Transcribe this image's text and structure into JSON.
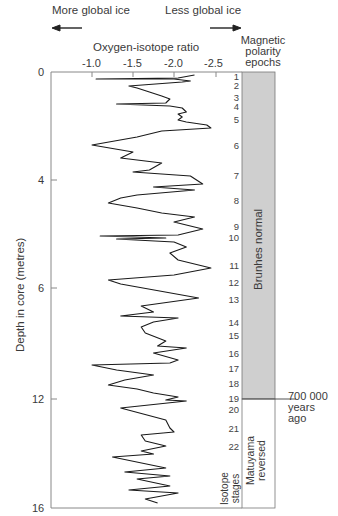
{
  "chart_data": {
    "type": "line",
    "title": "Oxygen-isotope ratio",
    "xlabel": "Oxygen-isotope ratio",
    "ylabel": "Depth in core (metres)",
    "x_ticks": [
      "-1.0",
      "-1.5",
      "-2.0",
      "-2.5"
    ],
    "x_reversed": true,
    "y_ticks": [
      "0",
      "4",
      "6",
      "12",
      "16"
    ],
    "grid": false,
    "annotations": {
      "left_arrow": "More global ice",
      "right_arrow": "Less global ice",
      "boundary": "700 000 years ago"
    },
    "series": [
      {
        "name": "Oxygen-isotope ratio vs depth",
        "points_ratio_ypx": [
          [
            -2.25,
            75
          ],
          [
            -2.05,
            78
          ],
          [
            -1.05,
            79
          ],
          [
            -2.0,
            79
          ],
          [
            -2.2,
            81
          ],
          [
            -2.1,
            82
          ],
          [
            -1.45,
            86
          ],
          [
            -1.55,
            88
          ],
          [
            -1.7,
            92
          ],
          [
            -1.85,
            96
          ],
          [
            -1.95,
            99
          ],
          [
            -1.9,
            103
          ],
          [
            -1.3,
            104
          ],
          [
            -1.95,
            106
          ],
          [
            -2.1,
            108
          ],
          [
            -2.15,
            112
          ],
          [
            -2.05,
            114
          ],
          [
            -2.1,
            117
          ],
          [
            -2.05,
            120
          ],
          [
            -2.15,
            122
          ],
          [
            -2.4,
            125
          ],
          [
            -2.45,
            128
          ],
          [
            -1.85,
            131
          ],
          [
            -1.55,
            137
          ],
          [
            -1.0,
            145
          ],
          [
            -1.5,
            152
          ],
          [
            -1.35,
            158
          ],
          [
            -1.85,
            163
          ],
          [
            -1.7,
            170
          ],
          [
            -1.5,
            172
          ],
          [
            -2.2,
            176
          ],
          [
            -2.35,
            184
          ],
          [
            -1.75,
            187
          ],
          [
            -2.25,
            190
          ],
          [
            -1.55,
            195
          ],
          [
            -1.35,
            198
          ],
          [
            -1.2,
            203
          ],
          [
            -1.55,
            208
          ],
          [
            -1.85,
            213
          ],
          [
            -2.25,
            217
          ],
          [
            -2.0,
            222
          ],
          [
            -2.35,
            229
          ],
          [
            -2.05,
            235
          ],
          [
            -1.1,
            236
          ],
          [
            -1.9,
            238
          ],
          [
            -1.3,
            239
          ],
          [
            -2.0,
            242
          ],
          [
            -2.15,
            247
          ],
          [
            -1.95,
            253
          ],
          [
            -2.05,
            260
          ],
          [
            -2.45,
            268
          ],
          [
            -2.0,
            275
          ],
          [
            -1.2,
            280
          ],
          [
            -1.35,
            284
          ],
          [
            -2.3,
            298
          ],
          [
            -1.6,
            306
          ],
          [
            -1.75,
            312
          ],
          [
            -1.35,
            316
          ],
          [
            -2.05,
            318
          ],
          [
            -1.75,
            322
          ],
          [
            -1.6,
            327
          ],
          [
            -1.65,
            333
          ],
          [
            -1.9,
            341
          ],
          [
            -1.8,
            346
          ],
          [
            -2.15,
            348
          ],
          [
            -1.75,
            353
          ],
          [
            -2.05,
            360
          ],
          [
            -1.95,
            363
          ],
          [
            -1.0,
            365
          ],
          [
            -1.3,
            370
          ],
          [
            -1.75,
            375
          ],
          [
            -1.4,
            380
          ],
          [
            -1.2,
            385
          ],
          [
            -1.55,
            389
          ],
          [
            -1.75,
            393
          ],
          [
            -2.05,
            397
          ],
          [
            -1.9,
            400
          ],
          [
            -2.15,
            401
          ],
          [
            -1.35,
            408
          ],
          [
            -1.9,
            420
          ],
          [
            -1.95,
            428
          ],
          [
            -2.0,
            432
          ],
          [
            -1.6,
            435
          ],
          [
            -1.65,
            441
          ],
          [
            -1.9,
            446
          ],
          [
            -1.6,
            451
          ],
          [
            -1.75,
            454
          ],
          [
            -1.25,
            457
          ],
          [
            -1.9,
            468
          ],
          [
            -1.4,
            472
          ],
          [
            -1.95,
            476
          ],
          [
            -1.55,
            479
          ],
          [
            -1.95,
            486
          ],
          [
            -1.45,
            490
          ],
          [
            -2.05,
            493
          ],
          [
            -1.65,
            499
          ],
          [
            -1.8,
            503
          ]
        ]
      }
    ],
    "isotope_stages": [
      {
        "n": "1",
        "y": 77
      },
      {
        "n": "2",
        "y": 86
      },
      {
        "n": "3",
        "y": 98
      },
      {
        "n": "4",
        "y": 107
      },
      {
        "n": "5",
        "y": 120
      },
      {
        "n": "6",
        "y": 146
      },
      {
        "n": "7",
        "y": 176
      },
      {
        "n": "8",
        "y": 201
      },
      {
        "n": "9",
        "y": 227
      },
      {
        "n": "10",
        "y": 238
      },
      {
        "n": "11",
        "y": 266
      },
      {
        "n": "12",
        "y": 283
      },
      {
        "n": "13",
        "y": 300
      },
      {
        "n": "14",
        "y": 323
      },
      {
        "n": "15",
        "y": 336
      },
      {
        "n": "16",
        "y": 354
      },
      {
        "n": "17",
        "y": 369
      },
      {
        "n": "18",
        "y": 384
      },
      {
        "n": "19",
        "y": 399
      },
      {
        "n": "20",
        "y": 410
      },
      {
        "n": "21",
        "y": 429
      },
      {
        "n": "22",
        "y": 447
      }
    ],
    "magnetic_epochs": [
      {
        "name": "Brunhes normal",
        "from_y": 72,
        "to_y": 399,
        "fill": "#cfcfcf"
      },
      {
        "name": "Matuyama reversed",
        "from_y": 399,
        "to_y": 508,
        "fill": "#ffffff"
      }
    ]
  },
  "labels": {
    "more_ice": "More global ice",
    "less_ice": "Less global ice",
    "x_title": "Oxygen-isotope ratio",
    "mag_title_1": "Magnetic",
    "mag_title_2": "polarity",
    "mag_title_3": "epochs",
    "y_title": "Depth in core (metres)",
    "brunhes": "Brunhes normal",
    "matuyama_1": "Matuyama",
    "matuyama_2": "reversed",
    "isotope_1": "Isotope",
    "isotope_2": "stages",
    "boundary_1": "700 000",
    "boundary_2": "years",
    "boundary_3": "ago",
    "x_ticks": [
      "-1.0",
      "-1.5",
      "-2.0",
      "-2.5"
    ],
    "y_ticks": [
      "0",
      "4",
      "6",
      "12",
      "16"
    ]
  }
}
